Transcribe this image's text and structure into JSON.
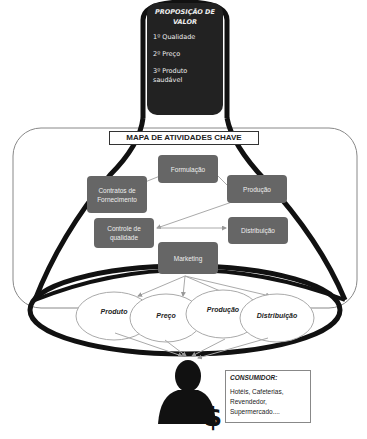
{
  "value_proposition": {
    "title": "PROPOSIÇÃO DE VALOR",
    "items": [
      "1º Qualidade",
      "2º Preço",
      "3º Produto saudável"
    ]
  },
  "activity_map": {
    "title": "MAPA DE ATIVIDADES CHAVE",
    "activities": [
      {
        "label": "Formulação"
      },
      {
        "label": "Contratos de Fornecimento"
      },
      {
        "label": "Produção"
      },
      {
        "label": "Controle de qualidade"
      },
      {
        "label": "Distribuição"
      },
      {
        "label": "Marketing"
      }
    ]
  },
  "marketing_mix": [
    "Produto",
    "Preço",
    "Produção",
    "Distribuição"
  ],
  "consumer": {
    "title": "CONSUMIDOR:",
    "lines": [
      "Hotéis, Cafeterias,",
      "Revendedor,",
      "Supermercado...."
    ]
  },
  "colors": {
    "activity_box": "#666666",
    "value_box": "#222222",
    "funnel": "#111111"
  }
}
